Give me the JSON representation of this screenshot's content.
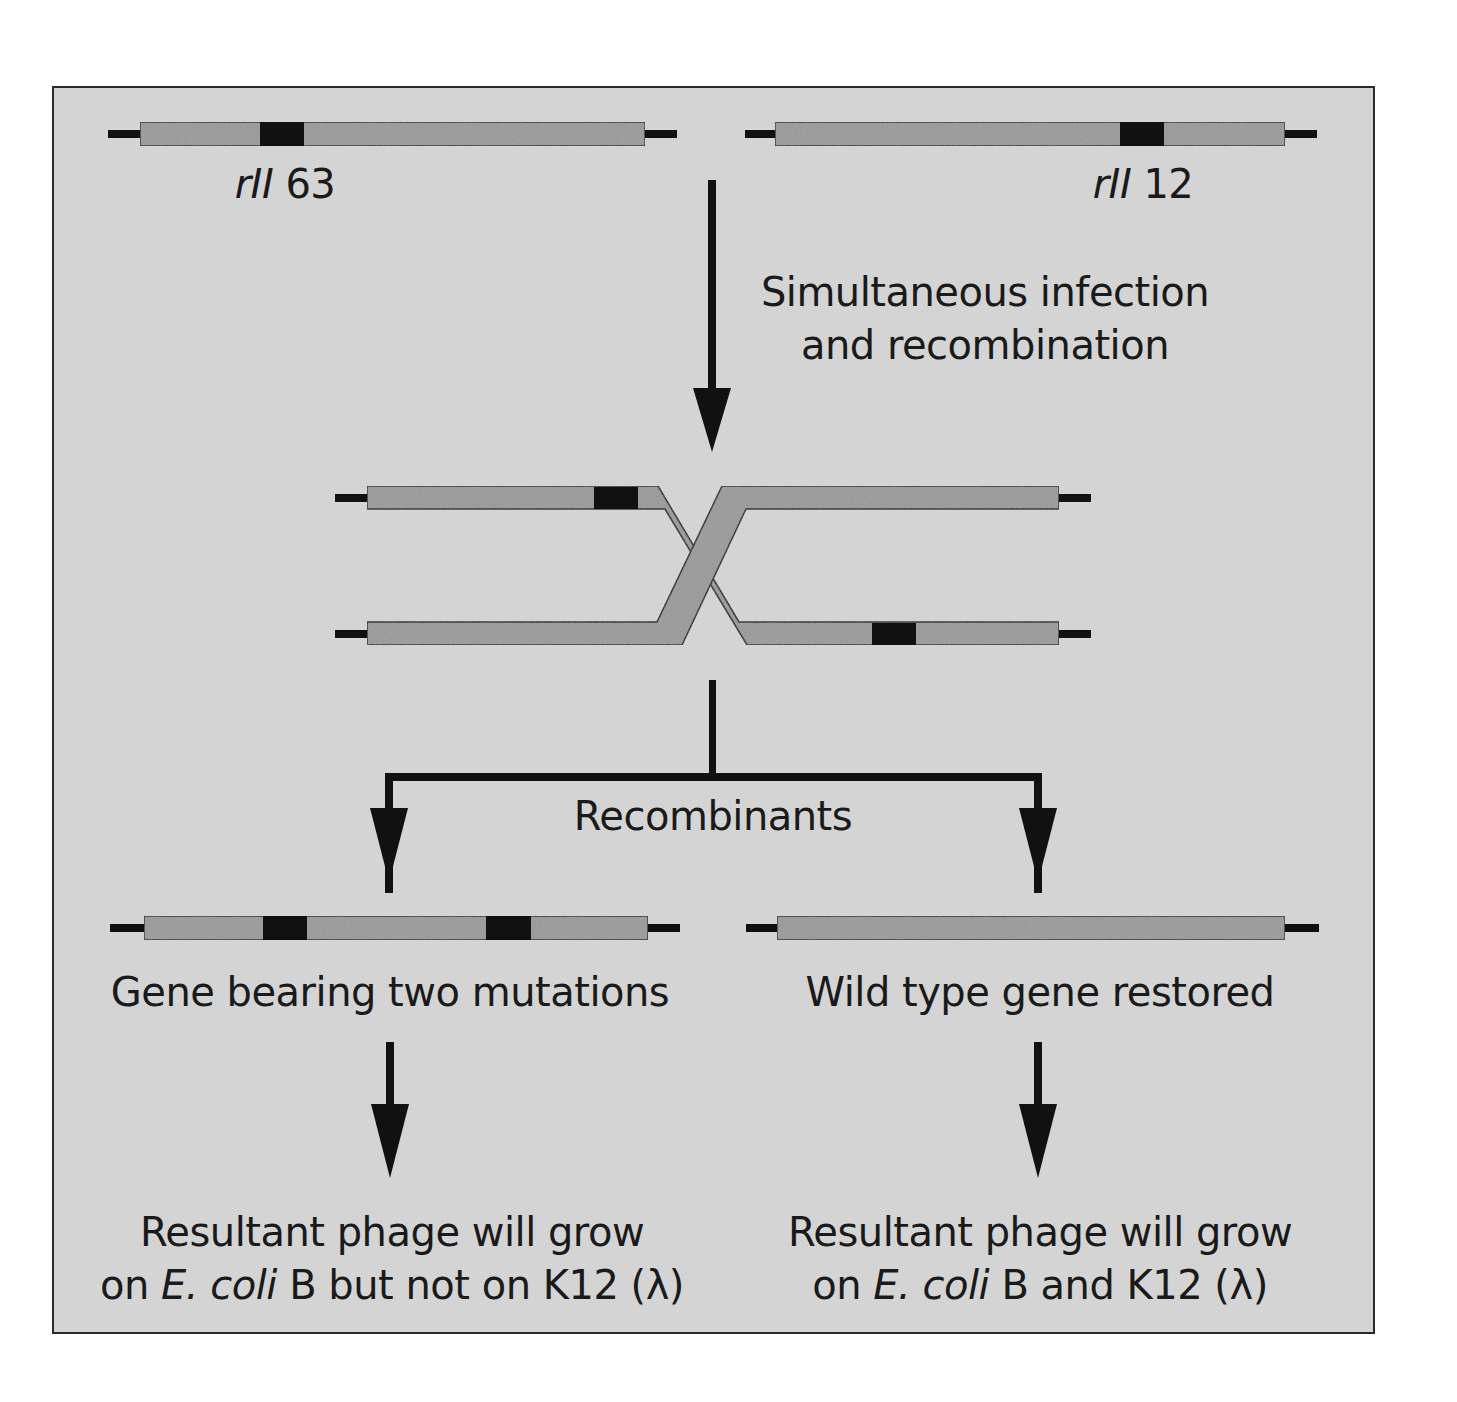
{
  "figure": {
    "colors": {
      "panel_background": "#d4d4d4",
      "gene_fill": "#9a9a9a",
      "mutation_fill": "#111111",
      "line": "#111111",
      "text": "#1a1a1a"
    }
  },
  "parents": [
    {
      "id": "rII63",
      "label_italic": "rII",
      "label_number": "63",
      "mutation_position": "left"
    },
    {
      "id": "rII12",
      "label_italic": "rII",
      "label_number": "12",
      "mutation_position": "right"
    }
  ],
  "steps": {
    "infection_label_line1": "Simultaneous infection",
    "infection_label_line2": "and recombination",
    "recombinants_label": "Recombinants"
  },
  "recombinants": [
    {
      "id": "double-mutant",
      "description": "Gene bearing two mutations",
      "mutation_count": 2,
      "outcome_line1": "Resultant phage will grow",
      "outcome_line2_prefix": "on ",
      "outcome_line2_species": "E. coli",
      "outcome_line2_suffix": " B but not on K12 (λ)"
    },
    {
      "id": "wild-type",
      "description": "Wild type gene restored",
      "mutation_count": 0,
      "outcome_line1": "Resultant phage will grow",
      "outcome_line2_prefix": "on ",
      "outcome_line2_species": "E. coli",
      "outcome_line2_suffix": " B and K12 (λ)"
    }
  ]
}
